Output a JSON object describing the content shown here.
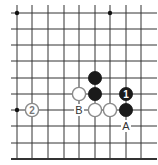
{
  "diagram": {
    "type": "go-board-section",
    "grid": {
      "x": [
        17,
        32,
        48,
        64,
        79,
        95,
        110,
        126,
        141
      ],
      "y": [
        13,
        29,
        45,
        61,
        78,
        94,
        110,
        126,
        143,
        159
      ],
      "left_overhang_to": 11,
      "top_overhang_to": 5,
      "right_extend_to": 157,
      "bottom_edge": true,
      "line_color": "#333333"
    },
    "star_points": [
      {
        "col": 0,
        "row": 0
      },
      {
        "col": 6,
        "row": 0
      },
      {
        "col": 0,
        "row": 6
      }
    ],
    "stones": [
      {
        "color": "black",
        "col": 5,
        "row": 4,
        "label": ""
      },
      {
        "color": "white",
        "col": 4,
        "row": 5,
        "label": ""
      },
      {
        "color": "black",
        "col": 5,
        "row": 5,
        "label": ""
      },
      {
        "color": "black",
        "col": 7,
        "row": 5,
        "label": "1"
      },
      {
        "color": "white",
        "col": 5,
        "row": 6,
        "label": ""
      },
      {
        "color": "white",
        "col": 6,
        "row": 6,
        "label": ""
      },
      {
        "color": "black",
        "col": 7,
        "row": 6,
        "label": ""
      },
      {
        "color": "white",
        "col": 1,
        "row": 6,
        "label": "2"
      }
    ],
    "marks": [
      {
        "label": "B",
        "col": 4,
        "row": 6
      },
      {
        "label": "A",
        "col": 7,
        "row": 7
      }
    ],
    "colors": {
      "black_stone": "#1a1a1a",
      "white_stone_fill": "#ffffff",
      "white_stone_stroke": "#8a8a8a",
      "label_on_black": "#ffffff",
      "label_on_white": "#777777",
      "mark_text": "#333333"
    }
  }
}
